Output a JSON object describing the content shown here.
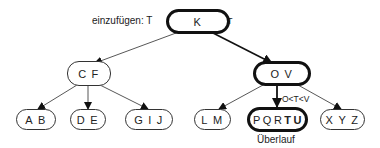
{
  "diagram": {
    "type": "b-tree-insertion",
    "annotations": {
      "insert_label": "einzufügen: T",
      "root_comparison": "K < T",
      "child_comparison": "O<T<V",
      "overflow_label": "Überlauf"
    },
    "nodes": {
      "root": {
        "keys": [
          "K"
        ],
        "highlight": true
      },
      "left": {
        "keys": [
          "C",
          "F"
        ],
        "highlight": false
      },
      "right": {
        "keys": [
          "O",
          "V"
        ],
        "highlight": true
      },
      "leaf_ab": {
        "keys": [
          "A",
          "B"
        ],
        "highlight": false
      },
      "leaf_de": {
        "keys": [
          "D",
          "E"
        ],
        "highlight": false
      },
      "leaf_gij": {
        "keys": [
          "G",
          "I",
          "J"
        ],
        "highlight": false
      },
      "leaf_lm": {
        "keys": [
          "L",
          "M"
        ],
        "highlight": false
      },
      "leaf_overflow": {
        "keys": [
          "P",
          "Q",
          "R",
          "T",
          "U"
        ],
        "bold_keys": [
          "T",
          "U"
        ],
        "highlight": true
      },
      "leaf_xyz": {
        "keys": [
          "X",
          "Y",
          "Z"
        ],
        "highlight": false
      }
    },
    "edges": [
      {
        "from": "root",
        "to": "left",
        "highlight": false
      },
      {
        "from": "root",
        "to": "right",
        "highlight": true
      },
      {
        "from": "left",
        "to": "leaf_ab",
        "highlight": false
      },
      {
        "from": "left",
        "to": "leaf_de",
        "highlight": false
      },
      {
        "from": "left",
        "to": "leaf_gij",
        "highlight": false
      },
      {
        "from": "right",
        "to": "leaf_lm",
        "highlight": false
      },
      {
        "from": "right",
        "to": "leaf_overflow",
        "highlight": true
      },
      {
        "from": "right",
        "to": "leaf_xyz",
        "highlight": false
      }
    ]
  }
}
